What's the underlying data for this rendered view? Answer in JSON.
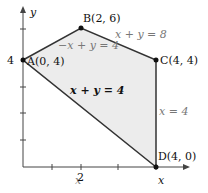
{
  "diagram": {
    "type": "feasible-region",
    "axes": {
      "x_label": "x",
      "y_label": "y",
      "x_tick_label": "2",
      "y_tick_label": "4"
    },
    "vertices": [
      {
        "id": "A",
        "label": "A(0, 4)",
        "x": 0,
        "y": 4
      },
      {
        "id": "B",
        "label": "B(2, 6)",
        "x": 2,
        "y": 6
      },
      {
        "id": "C",
        "label": "C(4, 4)",
        "x": 4,
        "y": 4
      },
      {
        "id": "D",
        "label": "D(4, 0)",
        "x": 4,
        "y": 0
      }
    ],
    "lines": {
      "ab": "−x + y = 4",
      "bc": "x + y = 8",
      "cd": "x = 4",
      "ad": "x + y = 4"
    },
    "colors": {
      "region_fill": "#ececec",
      "edge": "#333333",
      "axis": "#444444"
    }
  }
}
